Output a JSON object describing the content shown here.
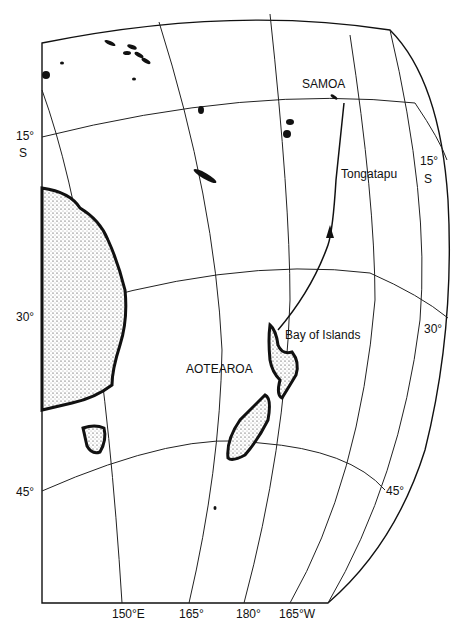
{
  "map": {
    "place_labels": {
      "samoa": "SAMOA",
      "tongatapu": "Tongatapu",
      "bay_of_islands": "Bay of Islands",
      "aotearoa": "AOTEAROA"
    },
    "latitude_labels": {
      "left_15": "15°",
      "left_15_s": "S",
      "right_15": "15°",
      "right_15_s": "S",
      "left_30": "30°",
      "right_30": "30°",
      "left_45": "45°",
      "right_45": "45°"
    },
    "longitude_labels": [
      "150°E",
      "165°",
      "180°",
      "165°W"
    ],
    "colors": {
      "ink": "#111111",
      "background": "#ffffff"
    }
  }
}
